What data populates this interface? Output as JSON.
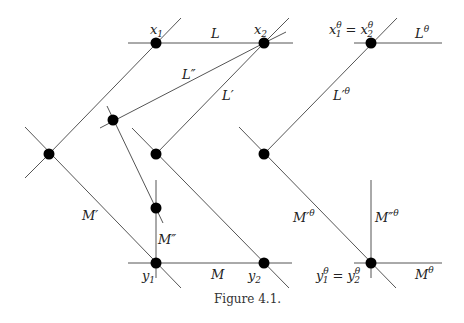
{
  "figure": {
    "caption": "Figure 4.1.",
    "labels": {
      "x1": "x",
      "x1_sub": "1",
      "x2": "x",
      "x2_sub": "2",
      "L": "L",
      "L_double_prime": "L″",
      "L_prime": "L′",
      "x_theta_eq": "x",
      "x_theta_sup": "θ",
      "x_theta_sub1": "1",
      "equals": "=",
      "x_theta_sub2": "2",
      "L_theta": "L",
      "L_prime_theta": "L′",
      "M_prime": "M′",
      "M_double_prime": "M″",
      "y1": "y",
      "y1_sub": "1",
      "M": "M",
      "y2": "y",
      "y2_sub": "2",
      "M_prime_theta": "M′",
      "M_double_prime_theta": "M″",
      "y_theta": "y",
      "y_theta_sub1": "1",
      "y_theta_sub2": "2",
      "M_theta": "M",
      "theta": "θ"
    }
  }
}
